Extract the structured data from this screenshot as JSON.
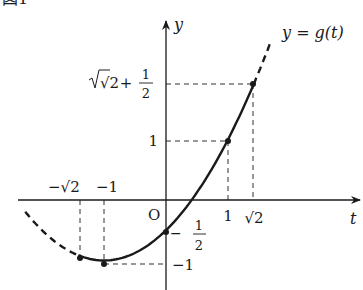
{
  "figure": {
    "caption": "図1",
    "curve_label": "y = g(t)",
    "axis_labels": {
      "x": "t",
      "y": "y",
      "origin": "O"
    }
  },
  "colors": {
    "ink": "#1a1a1a",
    "background": "#ffffff"
  },
  "chart_data": {
    "type": "line",
    "title": "図1",
    "function": "g(t) = (1/2)(t+1)^2 - 1",
    "xlabel": "t",
    "ylabel": "y",
    "series": [
      {
        "name": "y = g(t)",
        "solid_range": [
          -1.4142,
          1.4142
        ],
        "dashed_ranges": [
          [
            -2.27,
            -1.4142
          ],
          [
            1.4142,
            1.7
          ]
        ]
      }
    ],
    "marked_points": [
      {
        "t": -1.4142,
        "y": -0.9142,
        "t_label": "−√2"
      },
      {
        "t": -1,
        "y": -1,
        "t_label": "−1",
        "y_label": "−1"
      },
      {
        "t": 0,
        "y": -0.5,
        "y_label": "−1/2"
      },
      {
        "t": 1,
        "y": 1,
        "t_label": "1",
        "y_label": "1"
      },
      {
        "t": 1.4142,
        "y": 1.9142,
        "t_label": "√2",
        "y_label": "√2 + 1/2"
      }
    ],
    "x_tick_labels": [
      "−√2",
      "−1",
      "1",
      "√2"
    ],
    "y_tick_labels": [
      "√2 + 1/2",
      "1",
      "−1/2",
      "−1"
    ],
    "grid": false,
    "legend": "none"
  },
  "labels": {
    "neg_sqrt2": "−√2",
    "neg1_t": "−1",
    "one_t": "1",
    "sqrt2_t": "√2",
    "y_top_sqrt": "√2",
    "y_top_plus": "+",
    "half_num": "1",
    "half_den": "2",
    "one_y": "1",
    "neg_half_minus": "−",
    "neg_one_y": "−1"
  }
}
